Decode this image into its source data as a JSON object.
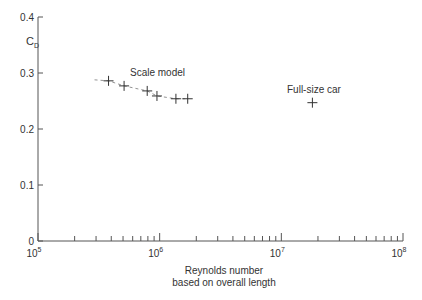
{
  "chart_data": {
    "type": "scatter",
    "title": "",
    "xlabel": "Reynolds number\nbased on overall length",
    "xlabel_lines": [
      "Reynolds number",
      "based on overall length"
    ],
    "ylabel": "C_D",
    "xscale": "log",
    "xlim": [
      100000,
      100000000
    ],
    "ylim": [
      0,
      0.4
    ],
    "grid": false,
    "x_ticks": [
      {
        "base": "10",
        "exp": "5"
      },
      {
        "base": "10",
        "exp": "6"
      },
      {
        "base": "10",
        "exp": "7"
      },
      {
        "base": "10",
        "exp": "8"
      }
    ],
    "y_ticks": [
      "0",
      "0.1",
      "0.2",
      "0.3",
      "0.4"
    ],
    "series": [
      {
        "name": "Scale model",
        "marker": "+",
        "trend_line": "dashed",
        "points": [
          {
            "x": 380000,
            "y": 0.286
          },
          {
            "x": 510000,
            "y": 0.277
          },
          {
            "x": 790000,
            "y": 0.268
          },
          {
            "x": 950000,
            "y": 0.259
          },
          {
            "x": 1360000,
            "y": 0.254
          },
          {
            "x": 1700000,
            "y": 0.254
          }
        ]
      },
      {
        "name": "Full-size car",
        "marker": "+",
        "points": [
          {
            "x": 18000000,
            "y": 0.247
          }
        ]
      }
    ],
    "annotations": [
      {
        "text": "Scale model",
        "near_series": 0
      },
      {
        "text": "Full-size car",
        "near_series": 1
      }
    ]
  },
  "labels": {
    "ylabel_main": "C",
    "ylabel_sub": "D",
    "xlabel_line1": "Reynolds number",
    "xlabel_line2": "based on overall length",
    "annot_scale": "Scale model",
    "annot_full": "Full-size car"
  }
}
